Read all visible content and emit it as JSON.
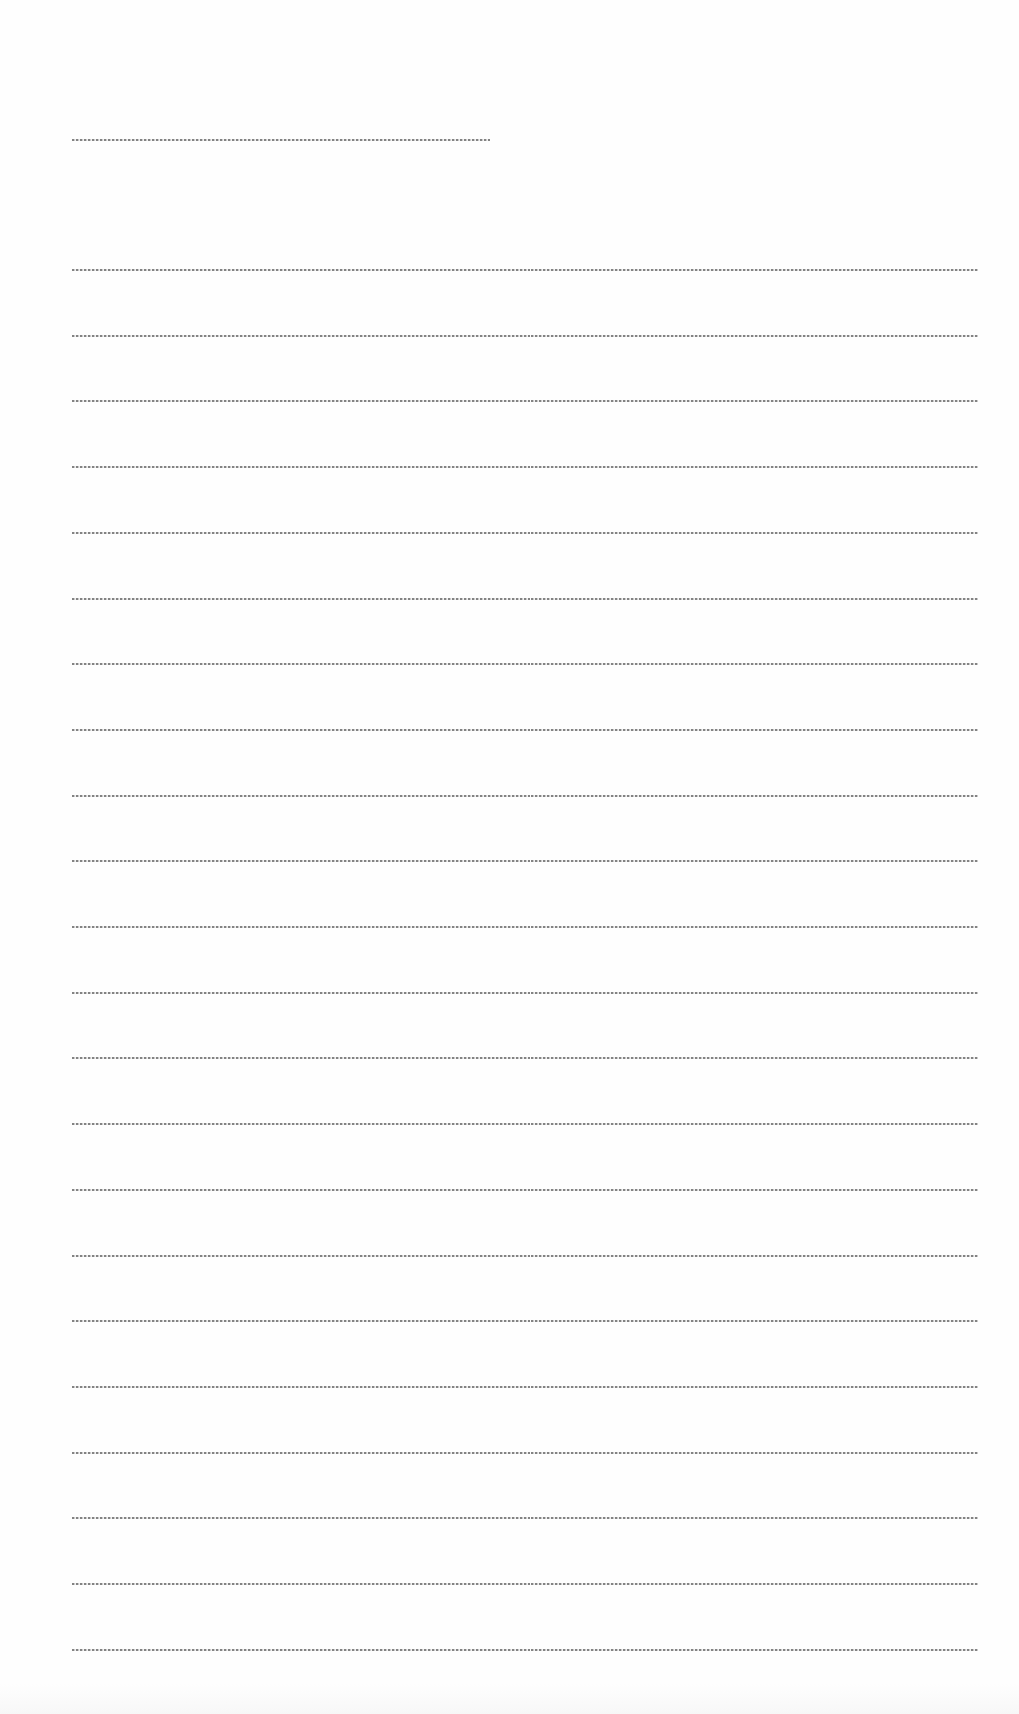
{
  "document": {
    "header": {
      "text": ""
    },
    "rows": [
      {
        "left": "",
        "right": ""
      },
      {
        "left": "",
        "right": ""
      },
      {
        "left": "",
        "right": ""
      },
      {
        "left": "",
        "right": ""
      },
      {
        "left": "",
        "right": ""
      },
      {
        "left": "",
        "right": ""
      },
      {
        "left": "",
        "right": ""
      },
      {
        "left": "",
        "right": ""
      },
      {
        "left": "",
        "right": ""
      },
      {
        "left": "",
        "right": ""
      },
      {
        "left": "",
        "right": ""
      },
      {
        "left": "",
        "right": ""
      },
      {
        "left": "",
        "right": ""
      },
      {
        "left": "",
        "right": ""
      },
      {
        "left": "",
        "right": ""
      },
      {
        "left": "",
        "right": ""
      },
      {
        "left": "",
        "right": ""
      },
      {
        "left": "",
        "right": ""
      },
      {
        "left": "",
        "right": ""
      },
      {
        "left": "",
        "right": ""
      },
      {
        "left": "",
        "right": ""
      },
      {
        "left": "",
        "right": ""
      }
    ],
    "layout": {
      "row_count": 22,
      "first_row_y": 269,
      "row_spacing": 65.7,
      "line_color": "#5a5a5a",
      "background": "#fefefe"
    }
  }
}
